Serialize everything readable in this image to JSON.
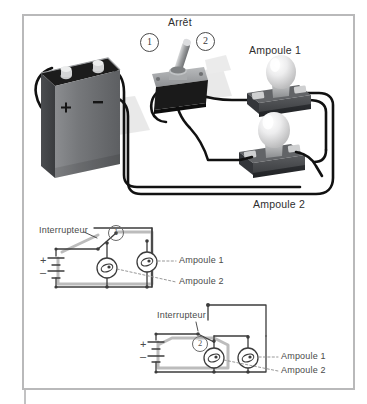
{
  "figure": {
    "kind": "electrical-circuit-illustration",
    "language": "fr",
    "photo": {
      "labels": {
        "switch_title": "Arrêt",
        "switch_position_1": "1",
        "switch_position_2": "2",
        "bulb_1": "Ampoule 1",
        "bulb_2": "Ampoule 2"
      },
      "battery": {
        "plus_sign": "+",
        "minus_sign": "–"
      }
    },
    "schematic_1": {
      "switch_label": "Interrupteur",
      "switch_position": "1",
      "battery_plus": "+",
      "battery_minus": "–",
      "bulb_1_label": "Ampoule 1",
      "bulb_2_label": "Ampoule 2"
    },
    "schematic_2": {
      "switch_label": "Interrupteur",
      "switch_position": "2",
      "battery_plus": "+",
      "battery_minus": "–",
      "bulb_1_label": "Ampoule 1",
      "bulb_2_label": "Ampoule 2"
    }
  },
  "colors": {
    "frame": "#b9b9ba",
    "wire": "#111111",
    "schematic_line": "#3c3c3c",
    "schematic_highlight": "#b8b8b8",
    "battery_body": "#6f7174",
    "battery_top": "#1b1b1b",
    "base_plate": "#4a4c4f",
    "bulb_glass": "#e9e9ea",
    "text": "#3b3b3b"
  }
}
